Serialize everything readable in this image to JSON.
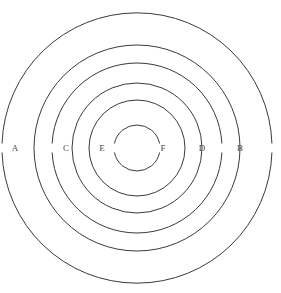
{
  "figure": {
    "type": "concentric-circles-diagram",
    "background_color": "#ffffff",
    "stroke_color": "#3a3a3a",
    "label_color": "#4a4a4a",
    "center": {
      "x": 137,
      "y": 148
    },
    "circles": [
      {
        "id": "circle-1",
        "radius": 135,
        "label_gap": true
      },
      {
        "id": "circle-2",
        "radius": 103,
        "label_gap": false
      },
      {
        "id": "circle-3",
        "radius": 85,
        "label_gap": true
      },
      {
        "id": "circle-4",
        "radius": 65,
        "label_gap": false
      },
      {
        "id": "circle-5",
        "radius": 48,
        "label_gap": false
      },
      {
        "id": "circle-6",
        "radius": 23,
        "label_gap": true
      }
    ],
    "labels": [
      {
        "id": "label-a",
        "text": "A",
        "x": 15,
        "y": 149,
        "circle": "circle-1",
        "side": "left"
      },
      {
        "id": "label-c",
        "text": "C",
        "x": 66,
        "y": 149,
        "circle": "circle-3",
        "side": "left"
      },
      {
        "id": "label-e",
        "text": "E",
        "x": 102,
        "y": 149,
        "circle": "circle-6",
        "side": "left"
      },
      {
        "id": "label-f",
        "text": "F",
        "x": 163,
        "y": 149,
        "circle": "circle-6",
        "side": "right"
      },
      {
        "id": "label-d",
        "text": "D",
        "x": 202,
        "y": 149,
        "circle": "circle-3",
        "side": "right"
      },
      {
        "id": "label-b",
        "text": "B",
        "x": 240,
        "y": 149,
        "circle": "circle-1",
        "side": "right"
      }
    ]
  },
  "chart_data": {
    "type": "diagram",
    "xlabel": "",
    "ylabel": "",
    "categories": [
      "A",
      "B",
      "C",
      "D",
      "E",
      "F"
    ],
    "values": [
      135,
      135,
      85,
      85,
      23,
      23
    ],
    "series": [
      {
        "name": "circle radius (px)",
        "values": [
          135,
          103,
          85,
          65,
          48,
          23
        ]
      }
    ],
    "annotations": [
      "A",
      "C",
      "E",
      "F",
      "D",
      "B"
    ],
    "legend": "none",
    "grid": false
  }
}
